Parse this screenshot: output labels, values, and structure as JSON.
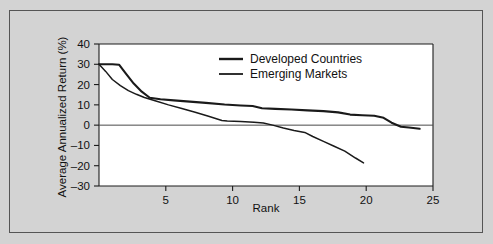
{
  "chart_data": {
    "type": "line",
    "title": "",
    "xlabel": "Rank",
    "ylabel": "Average Annualized Return (%)",
    "xlim": [
      0,
      25
    ],
    "ylim": [
      -30,
      40
    ],
    "xticks": [
      5,
      10,
      15,
      20,
      25
    ],
    "xtick_labels": [
      "5",
      "10",
      "15",
      "20",
      "25"
    ],
    "yticks": [
      -30,
      -20,
      -10,
      0,
      10,
      20,
      30,
      40
    ],
    "ytick_labels": [
      "–30",
      "–20",
      "–10",
      "0",
      "10",
      "20",
      "30",
      "40"
    ],
    "grid": false,
    "zero_line": true,
    "legend_position": "top-center",
    "series": [
      {
        "name": "Developed Countries",
        "x": [
          0,
          1.0,
          1.5,
          2.0,
          2.6,
          3.2,
          3.8,
          4.6,
          5.6,
          6.8,
          8.0,
          9.4,
          10.6,
          11.5,
          12.2,
          13.2,
          14.4,
          15.6,
          16.8,
          17.9,
          18.8,
          19.7,
          20.6,
          21.3,
          21.9,
          22.6,
          23.2,
          24.0
        ],
        "values": [
          30,
          30,
          29.8,
          25.5,
          20.5,
          16.5,
          13.5,
          12.8,
          12.2,
          11.6,
          11.0,
          10.2,
          9.7,
          9.4,
          8.3,
          8.0,
          7.7,
          7.3,
          6.9,
          6.3,
          5.2,
          4.9,
          4.6,
          3.6,
          1.2,
          -0.8,
          -1.2,
          -1.8
        ]
      },
      {
        "name": "Emerging Markets",
        "x": [
          0,
          0.5,
          1.0,
          1.6,
          2.2,
          2.8,
          3.4,
          4.2,
          5.2,
          6.2,
          7.2,
          8.2,
          9.2,
          9.6,
          10.6,
          11.6,
          12.3,
          13.0,
          13.8,
          14.6,
          15.4,
          16.0,
          16.8,
          17.6,
          18.4,
          19.2,
          19.8
        ],
        "values": [
          30,
          26.5,
          22.5,
          19.5,
          17.0,
          15.2,
          13.6,
          12.0,
          10.0,
          8.2,
          6.4,
          4.4,
          2.3,
          2.0,
          1.8,
          1.4,
          1.1,
          0.0,
          -1.4,
          -2.6,
          -3.6,
          -5.6,
          -8.0,
          -10.4,
          -12.8,
          -16.2,
          -18.6
        ]
      }
    ]
  },
  "legend": {
    "entries": [
      {
        "label": "Developed Countries",
        "icon": "line-swatch-icon"
      },
      {
        "label": "Emerging Markets",
        "icon": "line-swatch-icon"
      }
    ]
  }
}
